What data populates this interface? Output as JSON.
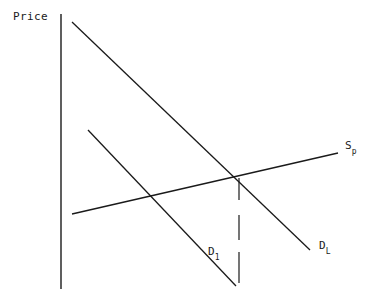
{
  "figure": {
    "axis_label": "Price",
    "background_color": "#ffffff",
    "line_color": "#1a1a1a",
    "width": 375,
    "height": 289
  },
  "labels": {
    "supply": {
      "base": "S",
      "sub": "p"
    },
    "demand_long": {
      "base": "D",
      "sub": "L"
    },
    "demand_short": {
      "base": "D",
      "sub": "1"
    }
  },
  "chart_data": {
    "type": "line",
    "title": "",
    "xlabel": "",
    "ylabel": "Price",
    "grid": false,
    "legend": "inline-curve-labels",
    "axes": {
      "y_axis": {
        "x": 61,
        "y_top": 14,
        "y_bottom": 289,
        "visible": true
      },
      "x_axis": {
        "visible": false
      }
    },
    "annotations": [
      {
        "name": "equilibrium-dashed-line",
        "type": "vertical-dashed",
        "x": 239,
        "y_start": 178,
        "y_end": 283,
        "dash_segments": [
          [
            178,
            200
          ],
          [
            215,
            240
          ],
          [
            252,
            283
          ]
        ]
      }
    ],
    "intersections": [
      {
        "name": "equilibrium",
        "curves": [
          "S_p",
          "D_L"
        ],
        "x": 238,
        "y": 177
      }
    ],
    "series": [
      {
        "name": "S_p",
        "label": "S",
        "sublabel": "p",
        "description": "supply curve, upward sloping",
        "points": [
          [
            72,
            214
          ],
          [
            338,
            153
          ]
        ],
        "slope": "positive-shallow"
      },
      {
        "name": "D_L",
        "label": "D",
        "sublabel": "L",
        "description": "long-run demand curve, downward sloping, flatter",
        "points": [
          [
            72,
            22
          ],
          [
            310,
            250
          ]
        ],
        "slope": "negative"
      },
      {
        "name": "D_1",
        "label": "D",
        "sublabel": "1",
        "description": "short-run demand curve, downward sloping, steeper",
        "points": [
          [
            88,
            130
          ],
          [
            236,
            286
          ]
        ],
        "slope": "negative-steep"
      }
    ]
  }
}
